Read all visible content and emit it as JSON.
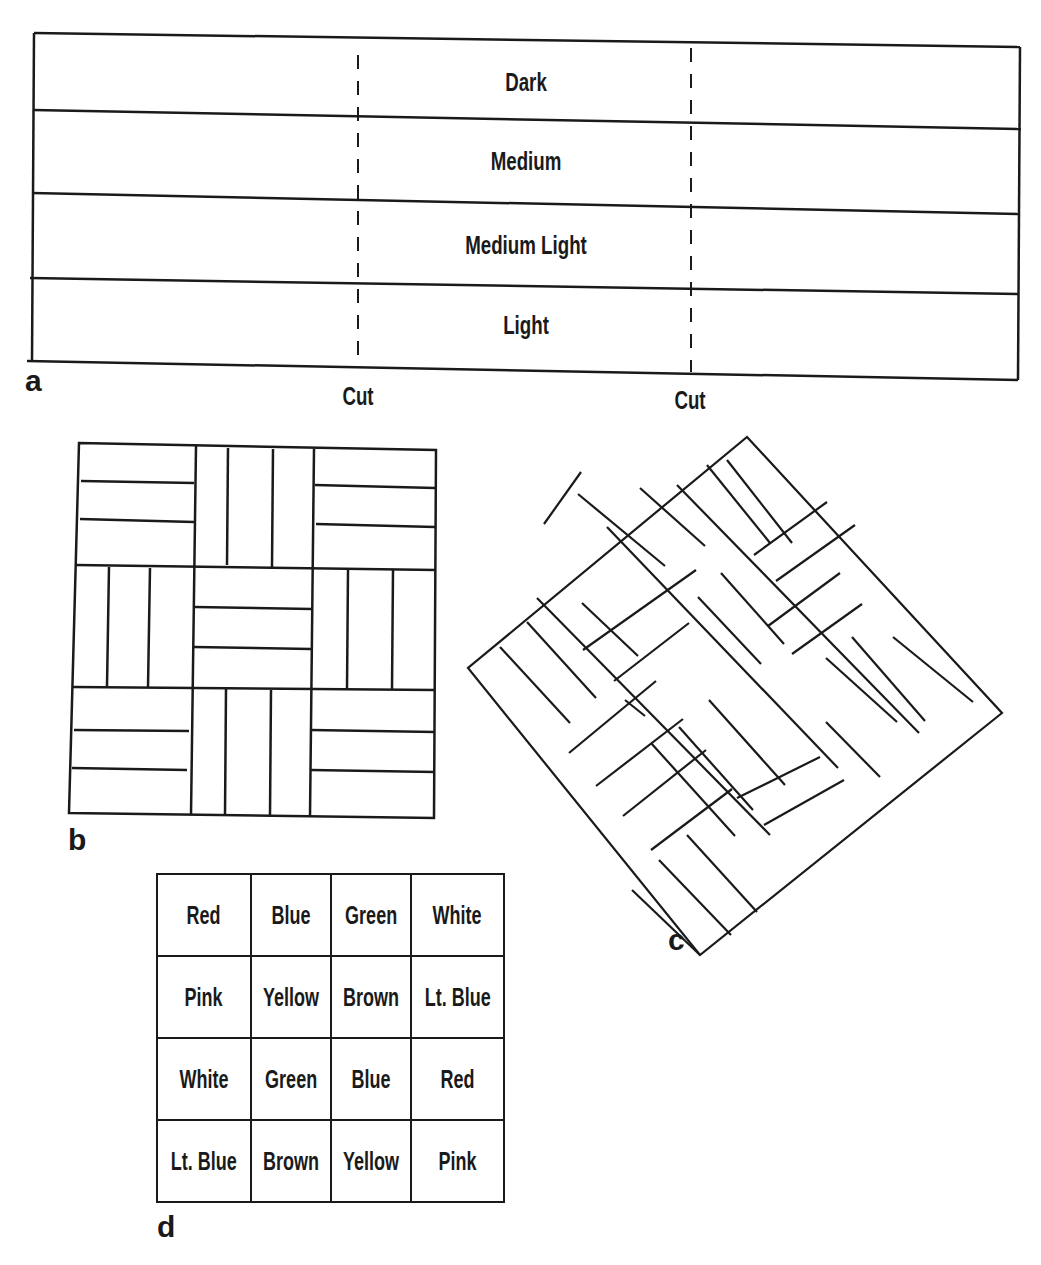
{
  "panels": {
    "a": {
      "letter": "a",
      "strips": [
        "Dark",
        "Medium",
        "Medium Light",
        "Light"
      ],
      "cut_labels": [
        "Cut",
        "Cut"
      ]
    },
    "b": {
      "letter": "b"
    },
    "c": {
      "letter": "c"
    },
    "d": {
      "letter": "d",
      "grid": [
        [
          "Red",
          "Blue",
          "Green",
          "White"
        ],
        [
          "Pink",
          "Yellow",
          "Brown",
          "Lt. Blue"
        ],
        [
          "White",
          "Green",
          "Blue",
          "Red"
        ],
        [
          "Lt. Blue",
          "Brown",
          "Yellow",
          "Pink"
        ]
      ]
    }
  },
  "colors": {
    "ink": "#1a1a1a",
    "paper": "#ffffff"
  }
}
